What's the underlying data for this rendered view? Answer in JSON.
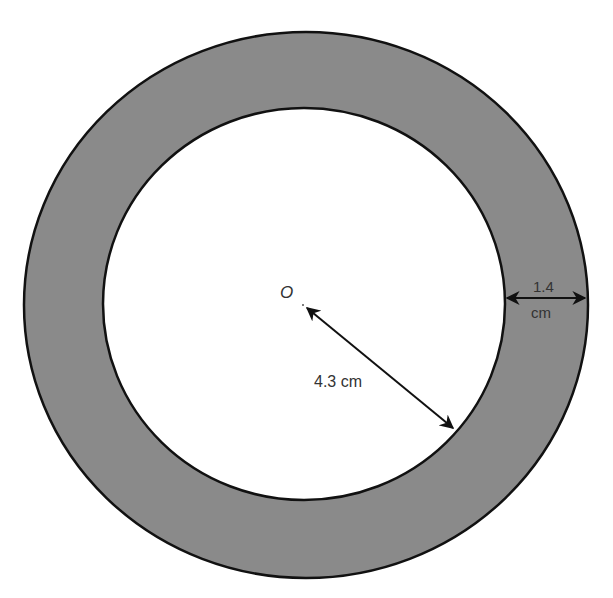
{
  "diagram": {
    "type": "annulus",
    "center_label": "O",
    "inner_radius_label": "4.3 cm",
    "ring_width_label_line1": "1.4",
    "ring_width_label_line2": "cm",
    "colors": {
      "ring_fill": "#8a8a8a",
      "inner_fill": "#ffffff",
      "stroke": "#111111",
      "text": "#333333"
    }
  }
}
